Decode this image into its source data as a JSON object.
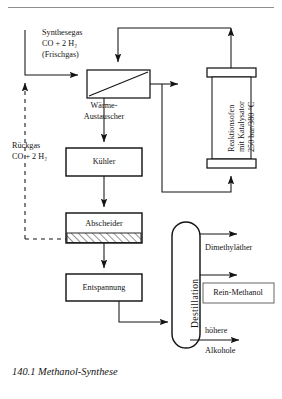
{
  "figure": {
    "caption": "140.1 Methanol-Synthese",
    "ink_color": "#141414",
    "rule_color": "#8e8e8e"
  },
  "feeds": {
    "synthesis_gas": {
      "line1": "Synthesegas",
      "line2": "CO + 2 H₂",
      "line3": "(Frischgas)"
    },
    "recycle_gas": {
      "line1": "Rückgas",
      "line2": "CO + 2 H₂"
    }
  },
  "units": {
    "heat_exchanger": {
      "line1": "Wärme-",
      "line2": "Austauscher"
    },
    "reactor": {
      "line1": "Reaktionsofen",
      "line2": "mit Katalysator",
      "line3": "250 bar/380 °C"
    },
    "cooler": {
      "label": "Kühler"
    },
    "separator": {
      "label": "Abscheider"
    },
    "expansion": {
      "label": "Entspannung"
    },
    "distillation": {
      "label": "Destillation"
    }
  },
  "products": {
    "dimethyl_ether": "Dimethyläther",
    "pure_methanol": "Rein-Methanol",
    "higher_alcohols": {
      "line1": "höhere",
      "line2": "Alkohole"
    }
  }
}
